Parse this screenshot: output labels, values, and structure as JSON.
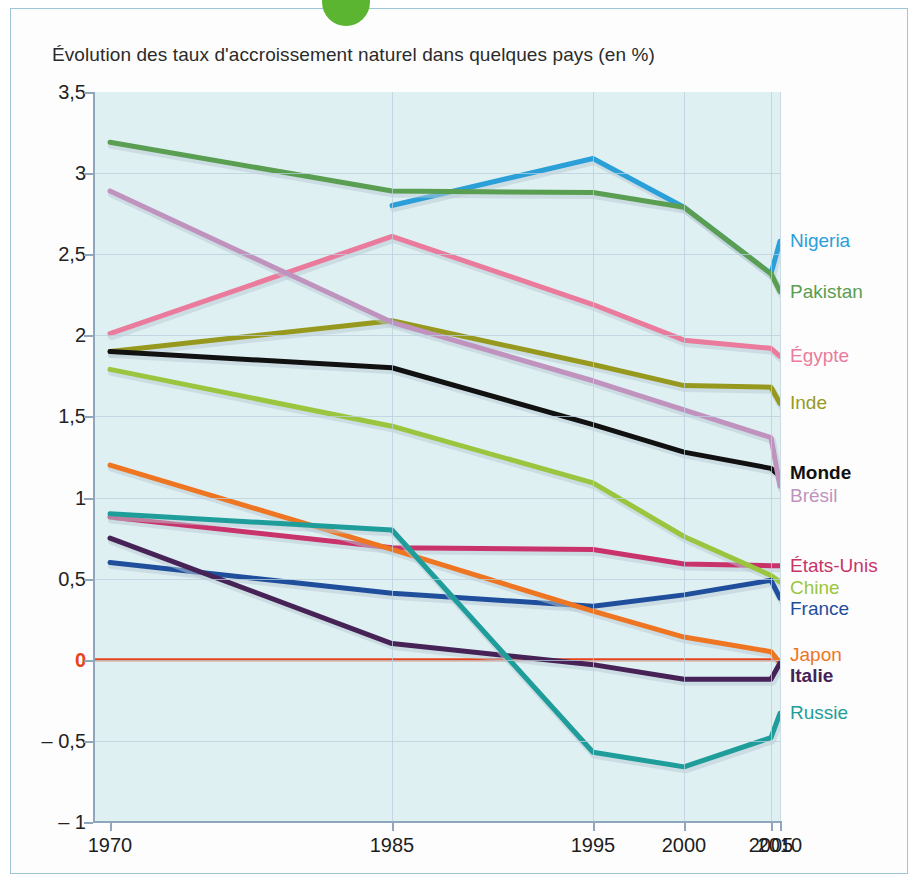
{
  "chart_title": "Évolution des taux d'accroissement naturel dans quelques pays (en %)",
  "axis": {
    "y_ticks": [
      "3,5",
      "3",
      "2,5",
      "2",
      "1,5",
      "1",
      "0,5",
      "0",
      "– 0,5",
      "– 1"
    ],
    "y_values": [
      3.5,
      3,
      2.5,
      2,
      1.5,
      1,
      0.5,
      0,
      -0.5,
      -1
    ],
    "x_ticks": [
      "1970",
      "1985",
      "1995",
      "2000",
      "2005",
      "2010"
    ],
    "zero_label_color": "#e8431a"
  },
  "colors": {
    "nigeria": "#2a9fd8",
    "pakistan": "#5a9e52",
    "egypte": "#ea7b9c",
    "inde": "#97991f",
    "monde": "#111111",
    "bresil": "#bf93be",
    "etats_unis": "#c9336b",
    "chine": "#9ac63f",
    "france": "#1f4f9c",
    "japon": "#ee7622",
    "italie": "#472257",
    "russie": "#1f9d9b",
    "zero_line": "#e8431a",
    "plot_background": "#dff0f3",
    "grid": "#b9cfdd",
    "frame_border": "#9dc6d8",
    "accent_dot": "#5bb531"
  },
  "legend": [
    {
      "name": "Nigeria",
      "color_key": "nigeria",
      "bold": false,
      "y": 2.58
    },
    {
      "name": "Pakistan",
      "color_key": "pakistan",
      "bold": false,
      "y": 2.27
    },
    {
      "name": "Égypte",
      "color_key": "egypte",
      "bold": false,
      "y": 1.87
    },
    {
      "name": "Inde",
      "color_key": "inde",
      "bold": false,
      "y": 1.58
    },
    {
      "name": "Monde",
      "color_key": "monde",
      "bold": true,
      "y": 1.15
    },
    {
      "name": "Brésil",
      "color_key": "bresil",
      "bold": false,
      "y": 1.01
    },
    {
      "name": "États-Unis",
      "color_key": "etats_unis",
      "bold": false,
      "y": 0.58
    },
    {
      "name": "Chine",
      "color_key": "chine",
      "bold": false,
      "y": 0.44
    },
    {
      "name": "France",
      "color_key": "france",
      "bold": false,
      "y": 0.31
    },
    {
      "name": "Japon",
      "color_key": "japon",
      "bold": false,
      "y": 0.03
    },
    {
      "name": "Italie",
      "color_key": "italie",
      "bold": true,
      "y": -0.1
    },
    {
      "name": "Russie",
      "color_key": "russie",
      "bold": false,
      "y": -0.33
    }
  ],
  "chart_data": {
    "type": "line",
    "title": "Évolution des taux d'accroissement naturel dans quelques pays (en %)",
    "xlabel": "",
    "ylabel": "",
    "x": [
      1970,
      1985,
      1995,
      2000,
      2005,
      2010
    ],
    "xtick_labels": [
      "1970",
      "1985",
      "1995",
      "2000",
      "2005",
      "2010"
    ],
    "ylim": [
      -1,
      3.5
    ],
    "ytick_labels": [
      "3,5",
      "3",
      "2,5",
      "2",
      "1,5",
      "1",
      "0,5",
      "0",
      "– 0,5",
      "– 1"
    ],
    "grid": true,
    "legend_position": "right",
    "annotations": [
      "Ligne zéro en rouge à 0 %"
    ],
    "series": [
      {
        "name": "Nigeria",
        "color": "#2a9fd8",
        "x": [
          1985,
          1995,
          2000,
          2005,
          2010
        ],
        "values": [
          2.8,
          3.09,
          2.79,
          2.38,
          2.58
        ]
      },
      {
        "name": "Pakistan",
        "color": "#5a9e52",
        "x": [
          1970,
          1985,
          1995,
          2000,
          2005,
          2010
        ],
        "values": [
          3.19,
          2.89,
          2.88,
          2.79,
          2.38,
          2.27
        ]
      },
      {
        "name": "Égypte",
        "color": "#ea7b9c",
        "x": [
          1970,
          1985,
          1995,
          2000,
          2005,
          2010
        ],
        "values": [
          2.01,
          2.61,
          2.19,
          1.97,
          1.92,
          1.87
        ]
      },
      {
        "name": "Inde",
        "color": "#97991f",
        "x": [
          1970,
          1985,
          1995,
          2000,
          2005,
          2010
        ],
        "values": [
          1.9,
          2.09,
          1.82,
          1.69,
          1.68,
          1.58
        ]
      },
      {
        "name": "Monde",
        "color": "#111111",
        "x": [
          1970,
          1985,
          1995,
          2000,
          2005,
          2010
        ],
        "values": [
          1.9,
          1.8,
          1.45,
          1.28,
          1.18,
          1.13
        ]
      },
      {
        "name": "Brésil",
        "color": "#bf93be",
        "x": [
          1970,
          1985,
          1995,
          2000,
          2005,
          2010
        ],
        "values": [
          2.89,
          2.08,
          1.72,
          1.54,
          1.37,
          1.07
        ]
      },
      {
        "name": "États-Unis",
        "color": "#c9336b",
        "x": [
          1970,
          1985,
          1995,
          2000,
          2005,
          2010
        ],
        "values": [
          0.88,
          0.69,
          0.68,
          0.59,
          0.58,
          0.58
        ]
      },
      {
        "name": "Chine",
        "color": "#9ac63f",
        "x": [
          1970,
          1985,
          1995,
          2000,
          2005,
          2010
        ],
        "values": [
          1.79,
          1.44,
          1.09,
          0.76,
          0.52,
          0.48
        ]
      },
      {
        "name": "France",
        "color": "#1f4f9c",
        "x": [
          1970,
          1985,
          1995,
          2000,
          2005,
          2010
        ],
        "values": [
          0.6,
          0.41,
          0.33,
          0.4,
          0.49,
          0.38
        ]
      },
      {
        "name": "Japon",
        "color": "#ee7622",
        "x": [
          1970,
          1985,
          1995,
          2000,
          2005,
          2010
        ],
        "values": [
          1.2,
          0.68,
          0.3,
          0.14,
          0.05,
          -0.02
        ]
      },
      {
        "name": "Italie",
        "color": "#472257",
        "x": [
          1970,
          1985,
          1995,
          2000,
          2005,
          2010
        ],
        "values": [
          0.75,
          0.1,
          -0.03,
          -0.12,
          -0.12,
          -0.02
        ]
      },
      {
        "name": "Russie",
        "color": "#1f9d9b",
        "x": [
          1970,
          1985,
          1995,
          2000,
          2005,
          2010
        ],
        "values": [
          0.9,
          0.8,
          -0.57,
          -0.66,
          -0.48,
          -0.33
        ]
      }
    ]
  }
}
